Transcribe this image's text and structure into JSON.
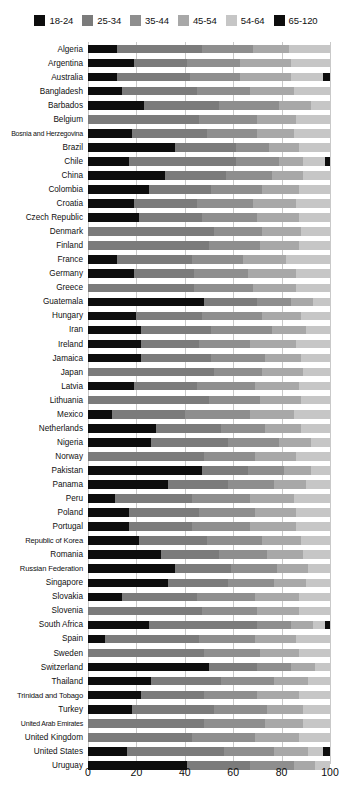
{
  "chart_data": {
    "type": "bar",
    "orientation": "horizontal",
    "stacked": true,
    "stack_mode": "percent",
    "title": "",
    "subtitle": "",
    "xlabel": "",
    "ylabel": "",
    "xlim": [
      0,
      100
    ],
    "xticks": [
      0,
      20,
      40,
      60,
      80,
      100
    ],
    "grid": true,
    "grid_axis": "x",
    "legend_position": "top-center",
    "series": [
      {
        "name": "18-24",
        "color": "#0d0d0d"
      },
      {
        "name": "25-34",
        "color": "#7b7b7b"
      },
      {
        "name": "35-44",
        "color": "#8e8e8e"
      },
      {
        "name": "45-54",
        "color": "#a8a8a8"
      },
      {
        "name": "54-64",
        "color": "#c6c6c6"
      },
      {
        "name": "65-120",
        "color": "#0d0d0d"
      }
    ],
    "categories": [
      "Algeria",
      "Argentina",
      "Australia",
      "Bangladesh",
      "Barbados",
      "Belgium",
      "Bosnia and Herzegovina",
      "Brazil",
      "Chile",
      "China",
      "Colombia",
      "Croatia",
      "Czech Republic",
      "Denmark",
      "Finland",
      "France",
      "Germany",
      "Greece",
      "Guatemala",
      "Hungary",
      "Iran",
      "Ireland",
      "Jamaica",
      "Japan",
      "Latvia",
      "Lithuania",
      "Mexico",
      "Netherlands",
      "Nigeria",
      "Norway",
      "Pakistan",
      "Panama",
      "Peru",
      "Poland",
      "Portugal",
      "Republic of Korea",
      "Romania",
      "Russian Federation",
      "Singapore",
      "Slovakia",
      "Slovenia",
      "South Africa",
      "Spain",
      "Sweden",
      "Switzerland",
      "Thailand",
      "Trinidad and Tobago",
      "Turkey",
      "United Arab Emirates",
      "United Kingdom",
      "United States",
      "Uruguay"
    ],
    "rows": [
      {
        "category": "Algeria",
        "values": [
          12,
          35,
          21,
          15,
          17,
          0
        ]
      },
      {
        "category": "Argentina",
        "values": [
          19,
          22,
          22,
          21,
          16,
          0
        ]
      },
      {
        "category": "Australia",
        "values": [
          12,
          30,
          21,
          21,
          13,
          3
        ]
      },
      {
        "category": "Bangladesh",
        "values": [
          14,
          31,
          22,
          18,
          15,
          0
        ]
      },
      {
        "category": "Barbados",
        "values": [
          23,
          31,
          25,
          13,
          8,
          0
        ]
      },
      {
        "category": "Belgium",
        "values": [
          0,
          46,
          24,
          16,
          14,
          0
        ]
      },
      {
        "category": "Bosnia and Herzegovina",
        "values": [
          18,
          31,
          21,
          15,
          15,
          0
        ]
      },
      {
        "category": "Brazil",
        "values": [
          36,
          25,
          14,
          12,
          13,
          0
        ]
      },
      {
        "category": "Chile",
        "values": [
          17,
          44,
          18,
          10,
          9,
          2
        ]
      },
      {
        "category": "China",
        "values": [
          32,
          25,
          19,
          13,
          11,
          0
        ]
      },
      {
        "category": "Colombia",
        "values": [
          25,
          26,
          21,
          15,
          13,
          0
        ]
      },
      {
        "category": "Croatia",
        "values": [
          19,
          26,
          23,
          18,
          14,
          0
        ]
      },
      {
        "category": "Czech Republic",
        "values": [
          21,
          26,
          23,
          17,
          13,
          0
        ]
      },
      {
        "category": "Denmark",
        "values": [
          0,
          52,
          20,
          16,
          12,
          0
        ]
      },
      {
        "category": "Finland",
        "values": [
          0,
          50,
          21,
          16,
          13,
          0
        ]
      },
      {
        "category": "France",
        "values": [
          12,
          31,
          21,
          18,
          18,
          0
        ]
      },
      {
        "category": "Germany",
        "values": [
          19,
          25,
          22,
          20,
          14,
          0
        ]
      },
      {
        "category": "Greece",
        "values": [
          0,
          44,
          24,
          18,
          14,
          0
        ]
      },
      {
        "category": "Guatemala",
        "values": [
          48,
          22,
          14,
          9,
          7,
          0
        ]
      },
      {
        "category": "Hungary",
        "values": [
          20,
          27,
          25,
          16,
          12,
          0
        ]
      },
      {
        "category": "Iran",
        "values": [
          22,
          29,
          25,
          14,
          10,
          0
        ]
      },
      {
        "category": "Ireland",
        "values": [
          22,
          24,
          21,
          19,
          14,
          0
        ]
      },
      {
        "category": "Jamaica",
        "values": [
          22,
          29,
          22,
          15,
          12,
          0
        ]
      },
      {
        "category": "Japan",
        "values": [
          0,
          52,
          20,
          17,
          11,
          0
        ]
      },
      {
        "category": "Latvia",
        "values": [
          19,
          26,
          24,
          18,
          13,
          0
        ]
      },
      {
        "category": "Lithuania",
        "values": [
          0,
          50,
          21,
          17,
          12,
          0
        ]
      },
      {
        "category": "Mexico",
        "values": [
          10,
          30,
          27,
          18,
          15,
          0
        ]
      },
      {
        "category": "Netherlands",
        "values": [
          28,
          27,
          18,
          15,
          12,
          0
        ]
      },
      {
        "category": "Nigeria",
        "values": [
          26,
          32,
          21,
          13,
          8,
          0
        ]
      },
      {
        "category": "Norway",
        "values": [
          0,
          48,
          21,
          17,
          14,
          0
        ]
      },
      {
        "category": "Pakistan",
        "values": [
          47,
          19,
          15,
          11,
          8,
          0
        ]
      },
      {
        "category": "Panama",
        "values": [
          33,
          25,
          19,
          13,
          10,
          0
        ]
      },
      {
        "category": "Peru",
        "values": [
          11,
          32,
          24,
          18,
          15,
          0
        ]
      },
      {
        "category": "Poland",
        "values": [
          17,
          29,
          23,
          17,
          14,
          0
        ]
      },
      {
        "category": "Portugal",
        "values": [
          17,
          26,
          24,
          19,
          14,
          0
        ]
      },
      {
        "category": "Republic of Korea",
        "values": [
          21,
          28,
          23,
          16,
          12,
          0
        ]
      },
      {
        "category": "Romania",
        "values": [
          30,
          24,
          20,
          15,
          11,
          0
        ]
      },
      {
        "category": "Russian Federation",
        "values": [
          36,
          23,
          19,
          13,
          9,
          0
        ]
      },
      {
        "category": "Singapore",
        "values": [
          33,
          25,
          19,
          13,
          10,
          0
        ]
      },
      {
        "category": "Slovakia",
        "values": [
          14,
          31,
          24,
          18,
          13,
          0
        ]
      },
      {
        "category": "Slovenia",
        "values": [
          0,
          47,
          23,
          17,
          13,
          0
        ]
      },
      {
        "category": "South Africa",
        "values": [
          25,
          45,
          14,
          9,
          5,
          2
        ]
      },
      {
        "category": "Spain",
        "values": [
          7,
          39,
          23,
          17,
          14,
          0
        ]
      },
      {
        "category": "Sweden",
        "values": [
          0,
          48,
          23,
          16,
          13,
          0
        ]
      },
      {
        "category": "Switzerland",
        "values": [
          50,
          20,
          14,
          10,
          6,
          0
        ]
      },
      {
        "category": "Thailand",
        "values": [
          26,
          29,
          22,
          14,
          9,
          0
        ]
      },
      {
        "category": "Trinidad and Tobago",
        "values": [
          22,
          26,
          22,
          17,
          13,
          0
        ]
      },
      {
        "category": "Turkey",
        "values": [
          18,
          34,
          22,
          15,
          11,
          0
        ]
      },
      {
        "category": "United Arab Emirates",
        "values": [
          0,
          48,
          25,
          16,
          11,
          0
        ]
      },
      {
        "category": "United Kingdom",
        "values": [
          0,
          43,
          26,
          18,
          13,
          0
        ]
      },
      {
        "category": "United States",
        "values": [
          16,
          40,
          21,
          14,
          6,
          3
        ]
      },
      {
        "category": "Uruguay",
        "values": [
          41,
          26,
          18,
          9,
          6,
          0
        ]
      }
    ]
  },
  "legend": {
    "entries": [
      {
        "label": "18-24",
        "color": "#0d0d0d"
      },
      {
        "label": "25-34",
        "color": "#7b7b7b"
      },
      {
        "label": "35-44",
        "color": "#8e8e8e"
      },
      {
        "label": "45-54",
        "color": "#a8a8a8"
      },
      {
        "label": "54-64",
        "color": "#c6c6c6"
      },
      {
        "label": "65-120",
        "color": "#0d0d0d"
      }
    ]
  },
  "axis": {
    "x_tick_labels": [
      "0",
      "20",
      "40",
      "60",
      "80",
      "100"
    ]
  }
}
